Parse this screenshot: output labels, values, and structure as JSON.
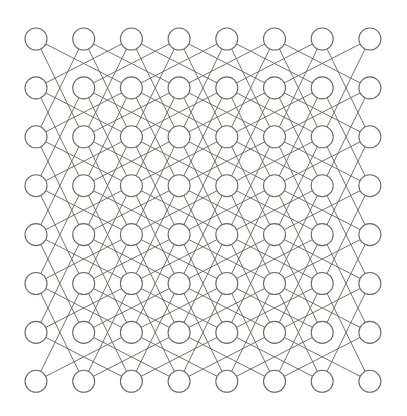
{
  "figure": {
    "name": "knight-move-graph",
    "canvas": {
      "width": 407,
      "height": 416,
      "background_color": "#ffffff"
    },
    "grid": {
      "rows": 8,
      "columns": 8,
      "node_count": 64,
      "edge_count": 168,
      "origin_x": 36,
      "origin_y": 39,
      "spacing_x": 47.7,
      "spacing_y": 48.9
    },
    "node_style": {
      "radius": 11,
      "fill_color": "#ffffff",
      "stroke_color": "#6b6b60",
      "stroke_width": 1.1
    },
    "edge_style": {
      "stroke_color": "#6b6b60",
      "stroke_width": 1.0,
      "opacity": 0.95
    },
    "move_offsets": [
      [
        1,
        2
      ],
      [
        2,
        1
      ],
      [
        2,
        -1
      ],
      [
        1,
        -2
      ],
      [
        -1,
        -2
      ],
      [
        -2,
        -1
      ],
      [
        -2,
        1
      ],
      [
        -1,
        2
      ]
    ]
  },
  "chart_data": {
    "type": "diagram",
    "subtype": "graph",
    "xlabel": "",
    "ylabel": "",
    "legend": [],
    "grid": false,
    "nodes_rows": 8,
    "nodes_columns": 8,
    "total_nodes": 64,
    "total_edges": 168,
    "degree_sequence_summary": {
      "corner_degree": 2,
      "edge_adjacent_degree": 3,
      "max_degree": 8,
      "min_degree": 2
    },
    "adjacency_rule": "cells (c,r) and (c',r') are joined when {|c-c'|,|r-r'|} = {1,2}"
  }
}
